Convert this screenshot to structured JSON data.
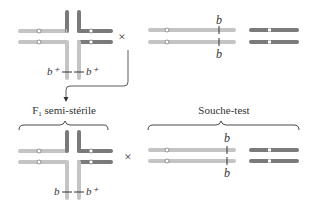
{
  "diagram": {
    "colors": {
      "light_chromosome": "#c4c4c4",
      "dark_chromosome": "#7a7a7a",
      "centromere_fill": "#ffffff",
      "line": "#333333",
      "text": "#333333"
    },
    "top_row": {
      "left": {
        "type": "translocation-cross",
        "labels": {
          "left_allele": "b⁺",
          "right_allele": "b⁺"
        }
      },
      "cross_symbol": "×",
      "right": {
        "type": "normal-chromosomes",
        "labels": {
          "top_allele": "b",
          "bottom_allele": "b"
        }
      }
    },
    "bottom_row": {
      "left": {
        "group_label": "F₁ semi-stérile",
        "group_label_main": "F",
        "group_label_sub": "1",
        "group_label_rest": " semi-stérile",
        "type": "translocation-cross",
        "labels": {
          "left_allele": "b",
          "right_allele": "b⁺"
        }
      },
      "cross_symbol": "×",
      "right": {
        "group_label": "Souche-test",
        "type": "normal-chromosomes",
        "labels": {
          "top_allele": "b",
          "bottom_allele": "b"
        }
      }
    }
  }
}
